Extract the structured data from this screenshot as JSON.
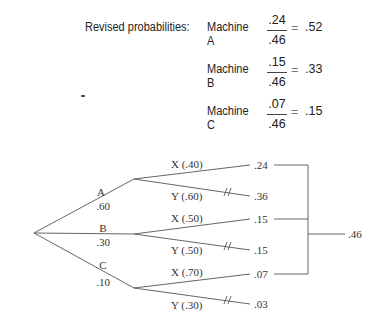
{
  "revised": {
    "label": "Revised probabilities:",
    "machines": [
      {
        "name": "Machine A",
        "numerator": ".24",
        "denominator": ".46",
        "equals": "=",
        "result": ".52"
      },
      {
        "name": "Machine B",
        "numerator": ".15",
        "denominator": ".46",
        "equals": "=",
        "result": ".33"
      },
      {
        "name": "Machine C",
        "numerator": ".07",
        "denominator": ".46",
        "equals": "=",
        "result": ".15"
      }
    ]
  },
  "tree": {
    "branches": [
      {
        "label": "A",
        "prob": ".60",
        "outcomes": [
          {
            "label": "X (.40)",
            "joint": ".24",
            "blocked": false
          },
          {
            "label": "Y (.60)",
            "joint": ".36",
            "blocked": true
          }
        ]
      },
      {
        "label": "B",
        "prob": ".30",
        "outcomes": [
          {
            "label": "X (.50)",
            "joint": ".15",
            "blocked": false
          },
          {
            "label": "Y (.50)",
            "joint": ".15",
            "blocked": true
          }
        ]
      },
      {
        "label": "C",
        "prob": ".10",
        "outcomes": [
          {
            "label": "X (.70)",
            "joint": ".07",
            "blocked": false
          },
          {
            "label": "Y (.30)",
            "joint": ".03",
            "blocked": true
          }
        ]
      }
    ],
    "total": ".46"
  }
}
